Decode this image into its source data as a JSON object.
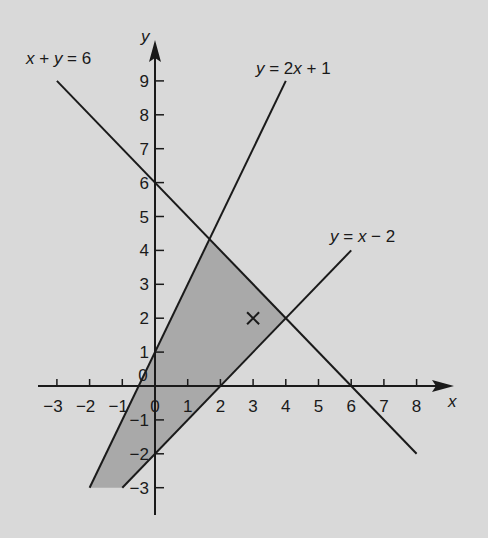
{
  "chart_data": {
    "type": "line",
    "title": "",
    "xlabel": "x",
    "ylabel": "y",
    "xlim": [
      -3.5,
      9
    ],
    "ylim": [
      -3.8,
      10
    ],
    "grid": false,
    "x_ticks": [
      -3,
      -2,
      -1,
      0,
      1,
      2,
      3,
      4,
      5,
      6,
      7,
      8
    ],
    "y_ticks": [
      -3,
      -2,
      -1,
      0,
      1,
      2,
      3,
      4,
      5,
      6,
      7,
      8,
      9
    ],
    "x_tick_labels": [
      "−3",
      "−2",
      "−1",
      "0",
      "1",
      "2",
      "3",
      "4",
      "5",
      "6",
      "7",
      "8"
    ],
    "y_tick_labels": [
      "−3",
      "−2",
      "−1",
      "0",
      "1",
      "2",
      "3",
      "4",
      "5",
      "6",
      "7",
      "8",
      "9"
    ],
    "series": [
      {
        "name": "x + y = 6",
        "label_parts": [
          "x",
          " + ",
          "y",
          " = 6"
        ],
        "points": [
          [
            -3,
            9
          ],
          [
            8,
            -2
          ]
        ]
      },
      {
        "name": "y = 2x + 1",
        "label_parts": [
          "y",
          " = 2",
          "x",
          " + 1"
        ],
        "points": [
          [
            -2,
            -3
          ],
          [
            4,
            9
          ]
        ]
      },
      {
        "name": "y = x − 2",
        "label_parts": [
          "y",
          " = ",
          "x",
          " − 2"
        ],
        "points": [
          [
            -1,
            -3
          ],
          [
            6,
            4
          ]
        ]
      }
    ],
    "shaded_region": {
      "description": "Feasible region bounded by y=2x+1, x+y=6, y=x-2 and y=-3",
      "vertices": [
        [
          -2,
          -3
        ],
        [
          1.667,
          4.333
        ],
        [
          4,
          2
        ],
        [
          -1,
          -3
        ]
      ],
      "color": "#a9a9a9"
    },
    "annotations": [
      {
        "type": "marker",
        "symbol": "×",
        "point": [
          3,
          2
        ]
      }
    ]
  },
  "colors": {
    "background": "#d9d9d9",
    "line": "#1a1a1a",
    "shade": "#a9a9a9"
  },
  "labels": {
    "x_axis": "x",
    "y_axis": "y",
    "eq1": "x + y = 6",
    "eq2": "y = 2x + 1",
    "eq3": "y = x − 2",
    "marker": "×"
  }
}
